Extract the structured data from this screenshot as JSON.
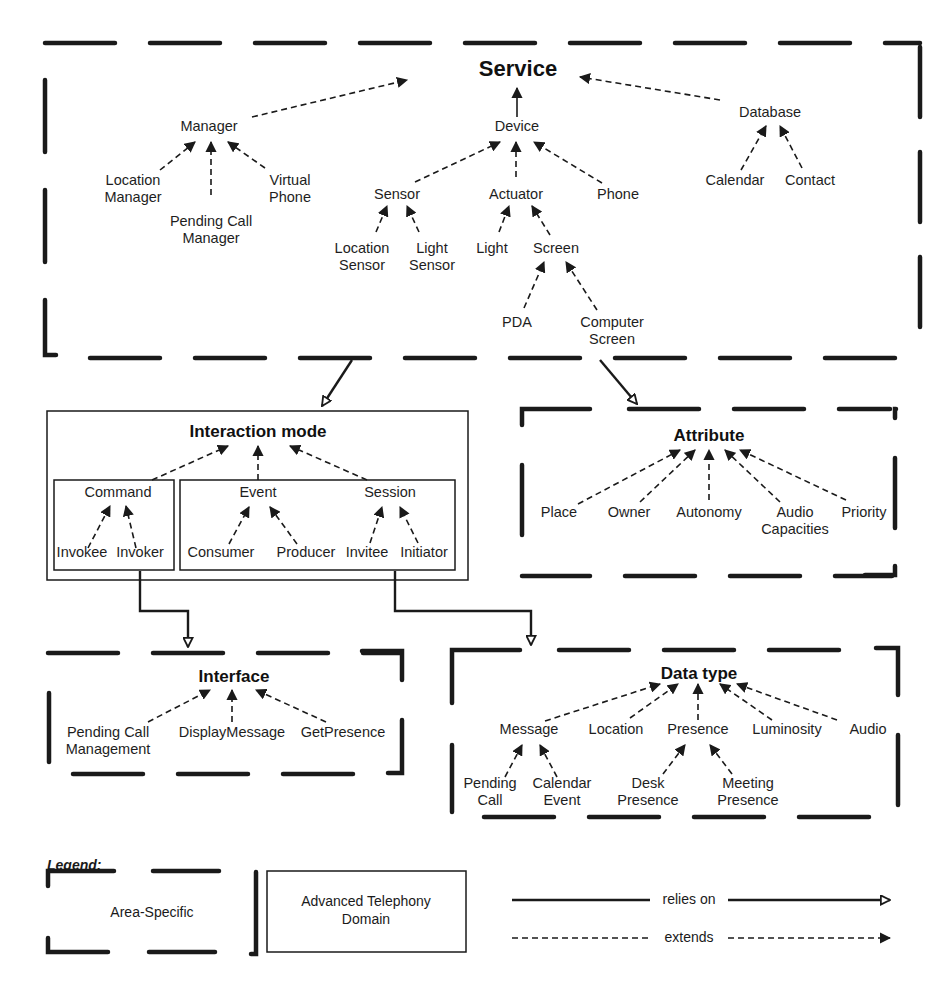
{
  "diagram": {
    "areas": {
      "service": {
        "title": "Service",
        "nodes": {
          "manager": "Manager",
          "location_manager": [
            "Location",
            "Manager"
          ],
          "pending_call_manager": [
            "Pending Call",
            "Manager"
          ],
          "virtual_phone": [
            "Virtual",
            "Phone"
          ],
          "device": "Device",
          "sensor": "Sensor",
          "actuator": "Actuator",
          "phone": "Phone",
          "location_sensor": [
            "Location",
            "Sensor"
          ],
          "light_sensor": [
            "Light",
            "Sensor"
          ],
          "light": "Light",
          "screen": "Screen",
          "pda": "PDA",
          "computer_screen": [
            "Computer",
            "Screen"
          ],
          "database": "Database",
          "calendar": "Calendar",
          "contact": "Contact"
        }
      },
      "interaction_mode": {
        "title": "Interaction mode",
        "nodes": {
          "command": "Command",
          "invokee": "Invokee",
          "invoker": "Invoker",
          "event": "Event",
          "consumer": "Consumer",
          "producer": "Producer",
          "session": "Session",
          "invitee": "Invitee",
          "initiator": "Initiator"
        }
      },
      "attribute": {
        "title": "Attribute",
        "nodes": {
          "place": "Place",
          "owner": "Owner",
          "autonomy": "Autonomy",
          "audio_capacities": [
            "Audio",
            "Capacities"
          ],
          "priority": "Priority"
        }
      },
      "interface": {
        "title": "Interface",
        "nodes": {
          "pending_call_management": [
            "Pending Call",
            "Management"
          ],
          "display_message": "DisplayMessage",
          "get_presence": "GetPresence"
        }
      },
      "data_type": {
        "title": "Data type",
        "nodes": {
          "message": "Message",
          "location": "Location",
          "presence": "Presence",
          "luminosity": "Luminosity",
          "audio": "Audio",
          "pending_call": [
            "Pending",
            "Call"
          ],
          "calendar_event": [
            "Calendar",
            "Event"
          ],
          "desk_presence": [
            "Desk",
            "Presence"
          ],
          "meeting_presence": [
            "Meeting",
            "Presence"
          ]
        }
      }
    },
    "legend": {
      "title": "Legend:",
      "area_specific": "Area-Specific",
      "domain": [
        "Advanced Telephony",
        "Domain"
      ],
      "relies_on": "relies on",
      "extends": "extends"
    },
    "relations": {
      "relies_on": [
        [
          "Service",
          "Interaction mode"
        ],
        [
          "Service",
          "Attribute"
        ],
        [
          "Command",
          "Interface"
        ],
        [
          "Session",
          "Data type"
        ]
      ]
    }
  }
}
